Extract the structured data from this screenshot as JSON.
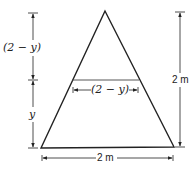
{
  "diagram": {
    "shape": "isosceles triangle",
    "labels": {
      "upper_height": "(2 − y)",
      "lower_height": "y",
      "chord_width": "(2 − y)",
      "total_height": "2 m",
      "base_width": "2 m"
    },
    "colors": {
      "stroke": "#222222",
      "background": "#ffffff"
    }
  }
}
